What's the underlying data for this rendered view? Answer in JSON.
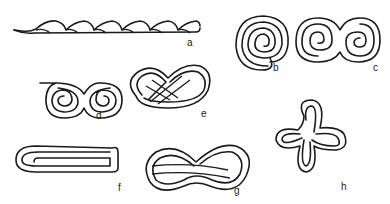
{
  "diagram": {
    "figures": [
      {
        "id": "a",
        "label": "a",
        "shape": "twisted-strand"
      },
      {
        "id": "b",
        "label": "b",
        "shape": "single-spiral"
      },
      {
        "id": "c",
        "label": "c",
        "shape": "double-spiral-s"
      },
      {
        "id": "d",
        "label": "d",
        "shape": "double-spiral-volute"
      },
      {
        "id": "e",
        "label": "e",
        "shape": "pretzel-knot"
      },
      {
        "id": "f",
        "label": "f",
        "shape": "folded-band-s"
      },
      {
        "id": "g",
        "label": "g",
        "shape": "figure-eight-knot"
      },
      {
        "id": "h",
        "label": "h",
        "shape": "four-lobed-knot"
      }
    ],
    "stroke_color": "#1a1a1a",
    "background": "#ffffff"
  }
}
